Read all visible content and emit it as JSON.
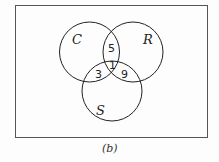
{
  "diagram": {
    "type": "venn",
    "sets": [
      {
        "name": "C",
        "label": "C"
      },
      {
        "name": "R",
        "label": "R"
      },
      {
        "name": "S",
        "label": "S"
      }
    ],
    "regions": {
      "C_and_R_only": "5",
      "C_and_S_only": "3",
      "R_and_S_only": "9",
      "C_and_R_and_S": "1"
    },
    "caption": "(b)"
  }
}
